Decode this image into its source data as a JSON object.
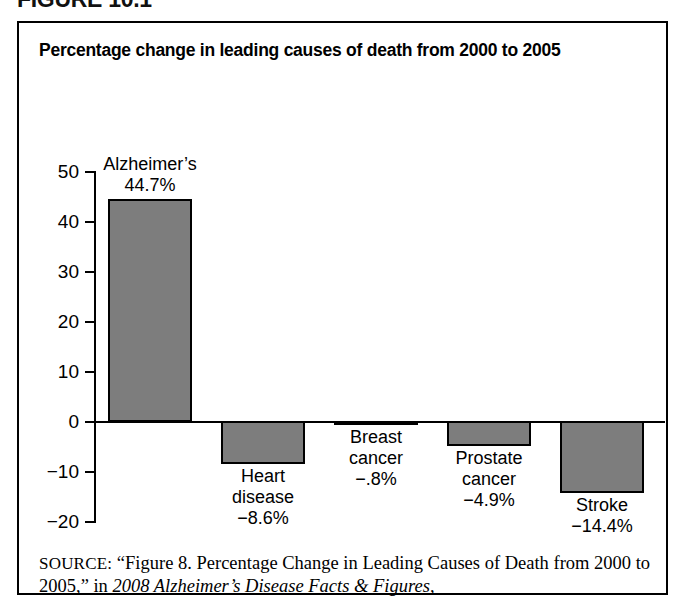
{
  "figure_heading": "FIGURE 10.1",
  "panel": {
    "title": "Percentage change in leading causes of death from 2000 to 2005"
  },
  "source": {
    "label": "SOURCE:",
    "text_before_italic": " “Figure 8. Percentage Change in Leading Causes of Death from 2000 to 2005,” in ",
    "italic_text": "2008 Alzheimer’s Disease Facts & Figures,",
    "full_text": "SOURCE: “Figure 8. Percentage Change in Leading Causes of Death from 2000 to 2005,” in 2008 Alzheimer’s Disease Facts & Figures,"
  },
  "colors": {
    "bar_fill": "#7d7d7d",
    "bar_stroke": "#000000",
    "axis": "#000000",
    "background": "#ffffff"
  },
  "chart_data": {
    "type": "bar",
    "title": "Percentage change in leading causes of death from 2000 to 2005",
    "xlabel": "",
    "ylabel": "",
    "ylim": [
      -20,
      50
    ],
    "grid": false,
    "legend": "none",
    "y_ticks": [
      "50",
      "40",
      "30",
      "20",
      "10",
      "0",
      "−10",
      "−20"
    ],
    "y_tick_values": [
      50,
      40,
      30,
      20,
      10,
      0,
      -10,
      -20
    ],
    "categories": [
      "Alzheimer’s",
      "Heart disease",
      "Breast cancer",
      "Prostate cancer",
      "Stroke"
    ],
    "values": [
      44.7,
      -8.6,
      -0.8,
      -4.9,
      -14.4
    ],
    "data_labels": [
      "44.7%",
      "−8.6%",
      "−.8%",
      "−4.9%",
      "−14.4%"
    ],
    "bars": [
      {
        "category": "Alzheimer’s",
        "value": 44.7,
        "name_lines": [
          "Alzheimer’s"
        ],
        "value_label": "44.7%",
        "label_position": "above"
      },
      {
        "category": "Heart disease",
        "value": -8.6,
        "name_lines": [
          "Heart",
          "disease"
        ],
        "value_label": "−8.6%",
        "label_position": "below"
      },
      {
        "category": "Breast cancer",
        "value": -0.8,
        "name_lines": [
          "Breast",
          "cancer"
        ],
        "value_label": "−.8%",
        "label_position": "below"
      },
      {
        "category": "Prostate cancer",
        "value": -4.9,
        "name_lines": [
          "Prostate",
          "cancer"
        ],
        "value_label": "−4.9%",
        "label_position": "below"
      },
      {
        "category": "Stroke",
        "value": -14.4,
        "name_lines": [
          "Stroke"
        ],
        "value_label": "−14.4%",
        "label_position": "below"
      }
    ]
  }
}
